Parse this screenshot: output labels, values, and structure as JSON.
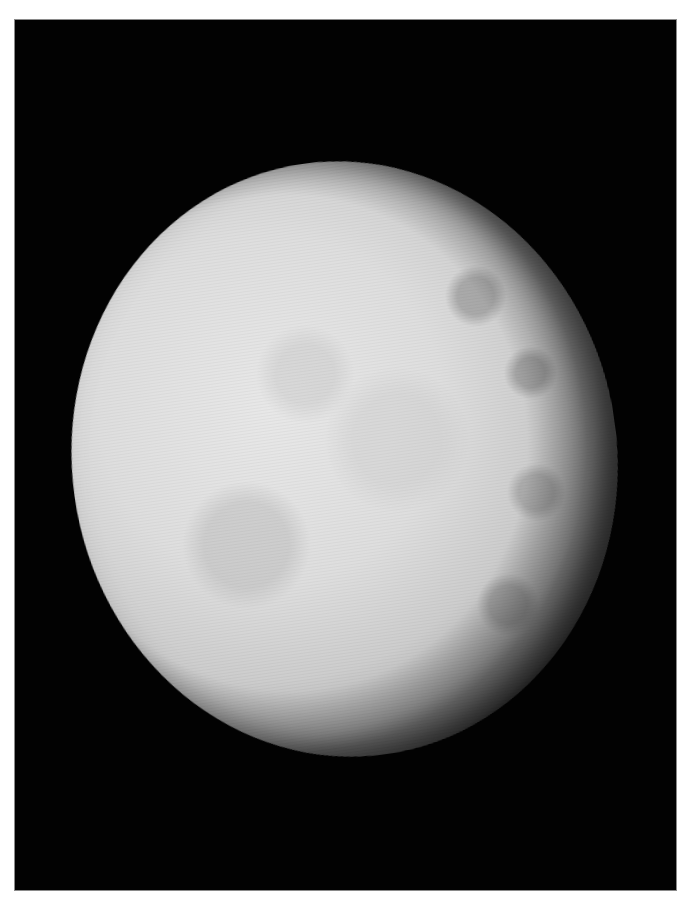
{
  "image": {
    "subject": "moon",
    "description": "Grayscale spacecraft photograph of a cratered icy moon against black space",
    "colors": {
      "page_background": "#ffffff",
      "frame_background": "#020202",
      "frame_border": "#8a8a8a",
      "moon_surface": "#dedede",
      "moon_terminator": "#3c3c3c"
    }
  }
}
